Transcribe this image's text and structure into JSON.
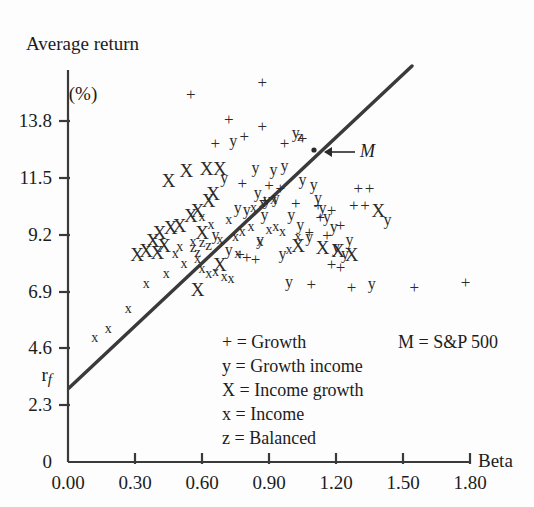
{
  "chart_data": {
    "type": "scatter",
    "title": "",
    "ylabel_line1": "Average return",
    "ylabel_line2": "(%)",
    "xlabel": "Beta",
    "xlim": [
      0.0,
      1.8
    ],
    "ylim": [
      0,
      15.5
    ],
    "grid": false,
    "xticks": [
      "0.00",
      "0.30",
      "0.60",
      "0.90",
      "1.20",
      "1.50",
      "1.80"
    ],
    "xtick_values": [
      0.0,
      0.3,
      0.6,
      0.9,
      1.2,
      1.5,
      1.8
    ],
    "yticks": [
      "0",
      "2.3",
      "4.6",
      "6.9",
      "9.2",
      "11.5",
      "13.8"
    ],
    "ytick_values": [
      0,
      2.3,
      4.6,
      6.9,
      9.2,
      11.5,
      13.8
    ],
    "rf_label": "r",
    "rf_subscript": "f",
    "rf_value": 3.0,
    "sml_line": {
      "label": "Security Market Line",
      "x_start": 0.0,
      "y_start": 3.0,
      "x_end": 1.53,
      "y_end": 14.9
    },
    "market_point": {
      "label": "M",
      "x": 1.1,
      "y": 12.6,
      "annotation": "M = S&P 500"
    },
    "legend_position": "inside-lower-center",
    "legend": [
      {
        "symbol": "+",
        "label": "Growth"
      },
      {
        "symbol": "y",
        "label": "Growth income"
      },
      {
        "symbol": "X",
        "label": "Income growth"
      },
      {
        "symbol": "x",
        "label": "Income"
      },
      {
        "symbol": "z",
        "label": "Balanced"
      }
    ],
    "series": [
      {
        "name": "Growth",
        "symbol": "+",
        "points": [
          [
            0.55,
            14.9
          ],
          [
            0.87,
            15.4
          ],
          [
            0.72,
            13.9
          ],
          [
            0.87,
            13.6
          ],
          [
            0.79,
            13.2
          ],
          [
            0.66,
            12.9
          ],
          [
            0.97,
            12.9
          ],
          [
            1.05,
            13.1
          ],
          [
            0.78,
            11.3
          ],
          [
            0.9,
            11.2
          ],
          [
            0.95,
            11.1
          ],
          [
            0.88,
            10.6
          ],
          [
            1.02,
            10.5
          ],
          [
            1.12,
            10.4
          ],
          [
            1.18,
            10.2
          ],
          [
            1.13,
            9.9
          ],
          [
            1.22,
            9.6
          ],
          [
            1.28,
            10.4
          ],
          [
            1.33,
            10.4
          ],
          [
            1.08,
            9.3
          ],
          [
            1.16,
            9.2
          ],
          [
            0.77,
            8.4
          ],
          [
            0.8,
            8.3
          ],
          [
            0.84,
            8.2
          ],
          [
            1.18,
            8.0
          ],
          [
            1.22,
            7.9
          ],
          [
            1.09,
            7.2
          ],
          [
            1.27,
            7.1
          ],
          [
            1.55,
            7.1
          ],
          [
            1.78,
            7.3
          ],
          [
            1.3,
            11.1
          ],
          [
            1.35,
            11.1
          ]
        ]
      },
      {
        "name": "Growth income",
        "symbol": "y",
        "points": [
          [
            0.74,
            13.0
          ],
          [
            0.84,
            11.9
          ],
          [
            0.92,
            11.8
          ],
          [
            0.97,
            12.0
          ],
          [
            1.02,
            13.3
          ],
          [
            0.7,
            11.5
          ],
          [
            1.05,
            11.4
          ],
          [
            1.1,
            11.2
          ],
          [
            0.85,
            10.9
          ],
          [
            0.89,
            10.6
          ],
          [
            0.93,
            10.7
          ],
          [
            0.76,
            10.3
          ],
          [
            0.8,
            10.2
          ],
          [
            0.88,
            10.0
          ],
          [
            1.12,
            10.7
          ],
          [
            1.14,
            10.3
          ],
          [
            1.16,
            9.9
          ],
          [
            1.19,
            9.5
          ],
          [
            1.04,
            9.6
          ],
          [
            1.08,
            9.1
          ],
          [
            0.86,
            9.0
          ],
          [
            0.66,
            9.2
          ],
          [
            0.72,
            8.6
          ],
          [
            0.96,
            8.4
          ],
          [
            1.2,
            8.7
          ],
          [
            1.24,
            8.4
          ],
          [
            1.26,
            9.0
          ],
          [
            1.43,
            9.8
          ],
          [
            1.36,
            7.2
          ],
          [
            0.99,
            7.3
          ],
          [
            1.0,
            10.0
          ]
        ]
      },
      {
        "name": "Income growth",
        "symbol": "X",
        "points": [
          [
            0.53,
            11.8
          ],
          [
            0.62,
            11.9
          ],
          [
            0.68,
            11.9
          ],
          [
            0.45,
            11.4
          ],
          [
            0.63,
            10.6
          ],
          [
            0.58,
            10.2
          ],
          [
            0.55,
            10.0
          ],
          [
            0.5,
            9.6
          ],
          [
            0.46,
            9.5
          ],
          [
            0.41,
            9.3
          ],
          [
            0.38,
            9.0
          ],
          [
            0.43,
            8.8
          ],
          [
            0.35,
            8.6
          ],
          [
            0.4,
            8.5
          ],
          [
            0.31,
            8.4
          ],
          [
            0.6,
            9.3
          ],
          [
            0.65,
            10.9
          ],
          [
            1.03,
            8.8
          ],
          [
            1.14,
            8.7
          ],
          [
            1.21,
            8.6
          ],
          [
            1.39,
            10.2
          ],
          [
            0.58,
            7.0
          ],
          [
            1.27,
            8.4
          ],
          [
            0.68,
            8.0
          ]
        ]
      },
      {
        "name": "Income",
        "symbol": "x",
        "points": [
          [
            0.12,
            5.0
          ],
          [
            0.18,
            5.4
          ],
          [
            0.27,
            6.2
          ],
          [
            0.35,
            7.2
          ],
          [
            0.44,
            7.6
          ],
          [
            0.52,
            8.0
          ],
          [
            0.58,
            8.2
          ],
          [
            0.6,
            7.8
          ],
          [
            0.63,
            7.6
          ],
          [
            0.66,
            7.7
          ],
          [
            0.7,
            7.5
          ],
          [
            0.73,
            7.4
          ],
          [
            0.48,
            8.4
          ],
          [
            0.56,
            8.9
          ],
          [
            0.75,
            9.1
          ],
          [
            0.78,
            9.3
          ],
          [
            0.82,
            9.5
          ],
          [
            0.5,
            8.7
          ],
          [
            0.86,
            8.9
          ],
          [
            0.9,
            9.4
          ],
          [
            0.93,
            9.5
          ],
          [
            0.96,
            9.3
          ],
          [
            0.99,
            8.6
          ],
          [
            1.03,
            9.1
          ],
          [
            0.83,
            10.3
          ],
          [
            0.87,
            10.5
          ],
          [
            0.92,
            10.6
          ],
          [
            0.72,
            9.8
          ],
          [
            0.68,
            9.0
          ],
          [
            0.76,
            8.4
          ],
          [
            0.6,
            9.9
          ],
          [
            0.64,
            9.6
          ]
        ]
      },
      {
        "name": "Balanced",
        "symbol": "z",
        "points": [
          [
            0.56,
            8.7
          ],
          [
            0.6,
            8.9
          ],
          [
            0.63,
            8.8
          ],
          [
            1.04,
            13.2
          ],
          [
            0.58,
            8.5
          ]
        ]
      }
    ]
  }
}
